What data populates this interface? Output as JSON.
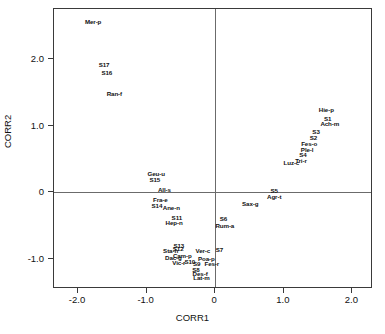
{
  "chart_data": {
    "type": "scatter",
    "title": "",
    "xlabel": "CORR1",
    "ylabel": "CORR2",
    "xlim": [
      -2.35,
      2.3
    ],
    "ylim": [
      -1.45,
      2.75
    ],
    "xticks": [
      -2.0,
      -1.0,
      0,
      1.0,
      2.0
    ],
    "xticklabels": [
      "-2.0",
      "-1.0",
      "0",
      "1.0",
      "2.0"
    ],
    "yticks": [
      -1.0,
      0,
      1.0,
      2.0
    ],
    "yticklabels": [
      "-1.0",
      "0",
      "1.0",
      "2.0"
    ],
    "grid": false,
    "legend": "none",
    "zero_lines": true,
    "marker": "text-label-only",
    "points": [
      {
        "label": "Mer-p",
        "x": -1.78,
        "y": 2.55
      },
      {
        "label": "S17",
        "x": -1.62,
        "y": 1.91
      },
      {
        "label": "S16",
        "x": -1.58,
        "y": 1.79
      },
      {
        "label": "Ran-f",
        "x": -1.47,
        "y": 1.47
      },
      {
        "label": "Geu-u",
        "x": -0.86,
        "y": 0.28
      },
      {
        "label": "S15",
        "x": -0.88,
        "y": 0.19
      },
      {
        "label": "All-s",
        "x": -0.74,
        "y": 0.03
      },
      {
        "label": "Fra-e",
        "x": -0.8,
        "y": -0.12
      },
      {
        "label": "S14",
        "x": -0.85,
        "y": -0.2
      },
      {
        "label": "Ane-n",
        "x": -0.64,
        "y": -0.24
      },
      {
        "label": "S11",
        "x": -0.56,
        "y": -0.38
      },
      {
        "label": "Hep-n",
        "x": -0.6,
        "y": -0.46
      },
      {
        "label": "S13",
        "x": -0.53,
        "y": -0.8
      },
      {
        "label": "S12",
        "x": -0.54,
        "y": -0.85
      },
      {
        "label": "Sta-h",
        "x": -0.65,
        "y": -0.88
      },
      {
        "label": "Cam-p",
        "x": -0.48,
        "y": -0.95
      },
      {
        "label": "Dac-g",
        "x": -0.61,
        "y": -0.98
      },
      {
        "label": "Vic-r",
        "x": -0.53,
        "y": -1.06
      },
      {
        "label": "S10",
        "x": -0.37,
        "y": -1.05
      },
      {
        "label": "S9",
        "x": -0.27,
        "y": -1.07
      },
      {
        "label": "S8",
        "x": -0.28,
        "y": -1.17
      },
      {
        "label": "Des-f",
        "x": -0.22,
        "y": -1.22
      },
      {
        "label": "Lat-m",
        "x": -0.2,
        "y": -1.29
      },
      {
        "label": "Ver-c",
        "x": -0.18,
        "y": -0.88
      },
      {
        "label": "Poa-p",
        "x": -0.13,
        "y": -1.0
      },
      {
        "label": "Fes-r",
        "x": -0.05,
        "y": -1.07
      },
      {
        "label": "S7",
        "x": 0.06,
        "y": -0.86
      },
      {
        "label": "S6",
        "x": 0.12,
        "y": -0.4
      },
      {
        "label": "Rum-a",
        "x": 0.14,
        "y": -0.51
      },
      {
        "label": "Sax-g",
        "x": 0.51,
        "y": -0.17
      },
      {
        "label": "S5",
        "x": 0.86,
        "y": 0.02
      },
      {
        "label": "Agr-t",
        "x": 0.86,
        "y": -0.07
      },
      {
        "label": "Luz-c",
        "x": 1.11,
        "y": 0.44
      },
      {
        "label": "Tri-r",
        "x": 1.25,
        "y": 0.47
      },
      {
        "label": "S4",
        "x": 1.28,
        "y": 0.56
      },
      {
        "label": "Ple-l",
        "x": 1.34,
        "y": 0.63
      },
      {
        "label": "Fes-o",
        "x": 1.37,
        "y": 0.73
      },
      {
        "label": "S2",
        "x": 1.43,
        "y": 0.81
      },
      {
        "label": "S3",
        "x": 1.47,
        "y": 0.9
      },
      {
        "label": "Ach-m",
        "x": 1.67,
        "y": 1.02
      },
      {
        "label": "S1",
        "x": 1.64,
        "y": 1.1
      },
      {
        "label": "Hie-p",
        "x": 1.62,
        "y": 1.23
      }
    ]
  }
}
